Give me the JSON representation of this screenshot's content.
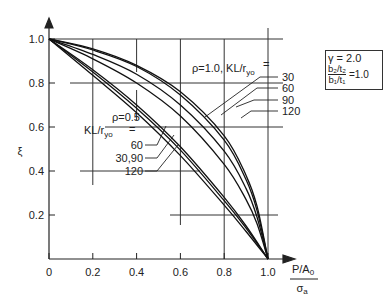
{
  "chart_data": {
    "type": "line",
    "title": "",
    "xlabel": "P/A0 / σa",
    "xlabel_numerator": "P/A",
    "xlabel_numerator_sub": "0",
    "xlabel_denominator": "σ",
    "xlabel_denominator_sub": "a",
    "ylabel": "ξ",
    "xlim": [
      0,
      1.0
    ],
    "ylim": [
      0,
      1.0
    ],
    "x_ticks": [
      "0",
      "0.2",
      "0.4",
      "0.6",
      "0.8",
      "1.0"
    ],
    "y_ticks": [
      "0.2",
      "0.4",
      "0.6",
      "0.8",
      "1.0"
    ],
    "grid": "partial cross-hair gridlines at 0.2 intervals",
    "legend": "none (inline annotations with leader arrows)",
    "parameters": {
      "gamma_label": "γ = 2.0",
      "ratio_numerator": "b2/t2",
      "ratio_denominator": "b1/t1",
      "ratio_value": "= 1.0"
    },
    "groups": [
      {
        "name": "ρ=1.0",
        "label": "ρ=1.0, KL/ryo =",
        "series": [
          {
            "name": "30",
            "x": [
              0,
              0.2,
              0.4,
              0.6,
              0.8,
              0.9,
              0.95,
              1.0
            ],
            "y": [
              1.0,
              0.955,
              0.88,
              0.76,
              0.56,
              0.38,
              0.24,
              0.0
            ]
          },
          {
            "name": "60",
            "x": [
              0,
              0.2,
              0.4,
              0.6,
              0.8,
              0.9,
              0.95,
              1.0
            ],
            "y": [
              1.0,
              0.95,
              0.875,
              0.745,
              0.54,
              0.36,
              0.22,
              0.0
            ]
          },
          {
            "name": "90",
            "x": [
              0,
              0.2,
              0.4,
              0.6,
              0.8,
              0.9,
              0.95,
              1.0
            ],
            "y": [
              1.0,
              0.93,
              0.84,
              0.7,
              0.49,
              0.32,
              0.19,
              0.0
            ]
          },
          {
            "name": "120",
            "x": [
              0,
              0.2,
              0.4,
              0.6,
              0.8,
              0.9,
              0.95,
              1.0
            ],
            "y": [
              1.0,
              0.91,
              0.8,
              0.65,
              0.43,
              0.27,
              0.16,
              0.0
            ]
          }
        ]
      },
      {
        "name": "ρ=0.5",
        "label": "ρ=0.5, KL/ryo =",
        "series": [
          {
            "name": "60",
            "x": [
              0,
              0.2,
              0.4,
              0.6,
              0.8,
              0.9,
              1.0
            ],
            "y": [
              1.0,
              0.86,
              0.7,
              0.51,
              0.28,
              0.15,
              0.0
            ]
          },
          {
            "name": "30,90",
            "x": [
              0,
              0.2,
              0.4,
              0.6,
              0.8,
              0.9,
              1.0
            ],
            "y": [
              1.0,
              0.85,
              0.685,
              0.495,
              0.265,
              0.14,
              0.0
            ]
          },
          {
            "name": "120",
            "x": [
              0,
              0.2,
              0.4,
              0.6,
              0.8,
              0.9,
              1.0
            ],
            "y": [
              1.0,
              0.835,
              0.665,
              0.47,
              0.245,
              0.125,
              0.0
            ]
          }
        ]
      }
    ]
  },
  "labels": {
    "y_axis": "ξ",
    "x_axis_num": "P/A",
    "x_axis_num_sub": "0",
    "x_axis_den": "σ",
    "x_axis_den_sub": "a",
    "rho1_label": "ρ=1.0, KL/r",
    "rho1_sub": "yo",
    "rho1_eq": "=",
    "rho1_values": [
      "30",
      "60",
      "90",
      "120"
    ],
    "rho05_label": "ρ=0.5",
    "rho05_kl": "KL/r",
    "rho05_sub": "yo",
    "rho05_eq": "=",
    "rho05_values": [
      "60",
      "30,90",
      "120"
    ],
    "gamma": "γ = 2.0",
    "b2t2": "b₂/t₂",
    "b1t1": "b₁/t₁",
    "ratio_eq": "=1.0"
  }
}
